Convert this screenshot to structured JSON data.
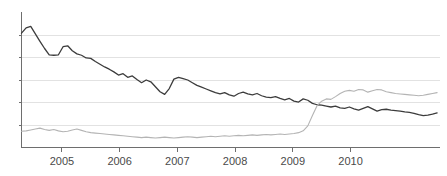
{
  "chart_data": {
    "type": "line",
    "title": "",
    "subtitle": "",
    "xlabel": "",
    "ylabel": "",
    "grid": true,
    "grid_axis": "y",
    "legend": "none",
    "background_color": "#ffffff",
    "axis_color": "#6e6e6e",
    "gridline_color": "#e2e2e2",
    "xlim": [
      2004.3,
      2011.55
    ],
    "ylim": [
      0,
      6
    ],
    "xticks": [
      2005,
      2006,
      2007,
      2008,
      2009,
      2010
    ],
    "xtick_labels": [
      "2005",
      "2006",
      "2007",
      "2008",
      "2009",
      "2010"
    ],
    "yticks": [
      1,
      2,
      3,
      4,
      5
    ],
    "ytick_labels": [
      "",
      "",
      "",
      "",
      ""
    ],
    "series": [
      {
        "name": "series-dark",
        "color": "#3c3c3c",
        "line_width": 1.3,
        "x": [
          2004.3,
          2004.38,
          2004.46,
          2004.54,
          2004.62,
          2004.7,
          2004.78,
          2004.86,
          2004.94,
          2005.02,
          2005.1,
          2005.18,
          2005.26,
          2005.34,
          2005.42,
          2005.5,
          2005.58,
          2005.66,
          2005.74,
          2005.82,
          2005.9,
          2005.98,
          2006.06,
          2006.14,
          2006.22,
          2006.3,
          2006.38,
          2006.46,
          2006.54,
          2006.62,
          2006.7,
          2006.78,
          2006.86,
          2006.94,
          2007.02,
          2007.1,
          2007.18,
          2007.26,
          2007.34,
          2007.42,
          2007.5,
          2007.58,
          2007.66,
          2007.74,
          2007.82,
          2007.9,
          2007.98,
          2008.06,
          2008.14,
          2008.22,
          2008.3,
          2008.38,
          2008.46,
          2008.54,
          2008.62,
          2008.7,
          2008.78,
          2008.86,
          2008.94,
          2009.02,
          2009.1,
          2009.18,
          2009.26,
          2009.34,
          2009.42,
          2009.5,
          2009.58,
          2009.66,
          2009.74,
          2009.82,
          2009.9,
          2009.98,
          2010.06,
          2010.14,
          2010.22,
          2010.3,
          2010.38,
          2010.46,
          2010.54,
          2010.62,
          2010.7,
          2010.78,
          2010.86,
          2010.94,
          2011.02,
          2011.1,
          2011.18,
          2011.26,
          2011.34,
          2011.42,
          2011.5
        ],
        "values": [
          5.08,
          5.32,
          5.38,
          5.05,
          4.72,
          4.4,
          4.12,
          4.1,
          4.12,
          4.48,
          4.52,
          4.3,
          4.16,
          4.1,
          3.98,
          3.96,
          3.82,
          3.7,
          3.58,
          3.48,
          3.36,
          3.22,
          3.28,
          3.12,
          3.18,
          3.02,
          2.88,
          3.0,
          2.92,
          2.7,
          2.48,
          2.36,
          2.62,
          3.04,
          3.12,
          3.06,
          3.0,
          2.88,
          2.76,
          2.68,
          2.6,
          2.52,
          2.44,
          2.38,
          2.44,
          2.34,
          2.28,
          2.4,
          2.46,
          2.38,
          2.34,
          2.4,
          2.3,
          2.24,
          2.22,
          2.26,
          2.18,
          2.12,
          2.18,
          2.06,
          2.02,
          2.16,
          2.1,
          1.96,
          1.9,
          1.88,
          1.84,
          1.8,
          1.84,
          1.76,
          1.74,
          1.8,
          1.72,
          1.66,
          1.74,
          1.82,
          1.72,
          1.62,
          1.68,
          1.7,
          1.66,
          1.64,
          1.62,
          1.58,
          1.56,
          1.52,
          1.46,
          1.42,
          1.44,
          1.48,
          1.54
        ]
      },
      {
        "name": "series-light",
        "color": "#b4b4b4",
        "line_width": 1.1,
        "x": [
          2004.3,
          2004.38,
          2004.46,
          2004.54,
          2004.62,
          2004.7,
          2004.78,
          2004.86,
          2004.94,
          2005.02,
          2005.1,
          2005.18,
          2005.26,
          2005.34,
          2005.42,
          2005.5,
          2005.58,
          2005.66,
          2005.74,
          2005.82,
          2005.9,
          2005.98,
          2006.06,
          2006.14,
          2006.22,
          2006.3,
          2006.38,
          2006.46,
          2006.54,
          2006.62,
          2006.7,
          2006.78,
          2006.86,
          2006.94,
          2007.02,
          2007.1,
          2007.18,
          2007.26,
          2007.34,
          2007.42,
          2007.5,
          2007.58,
          2007.66,
          2007.74,
          2007.82,
          2007.9,
          2007.98,
          2008.06,
          2008.14,
          2008.22,
          2008.3,
          2008.38,
          2008.46,
          2008.54,
          2008.62,
          2008.7,
          2008.78,
          2008.86,
          2008.94,
          2009.02,
          2009.1,
          2009.18,
          2009.26,
          2009.34,
          2009.42,
          2009.5,
          2009.58,
          2009.66,
          2009.74,
          2009.82,
          2009.9,
          2009.98,
          2010.06,
          2010.14,
          2010.22,
          2010.3,
          2010.38,
          2010.46,
          2010.54,
          2010.62,
          2010.7,
          2010.78,
          2010.86,
          2010.94,
          2011.02,
          2011.1,
          2011.18,
          2011.26,
          2011.34,
          2011.42,
          2011.5
        ],
        "values": [
          0.72,
          0.74,
          0.78,
          0.82,
          0.86,
          0.8,
          0.76,
          0.8,
          0.74,
          0.7,
          0.72,
          0.78,
          0.82,
          0.76,
          0.7,
          0.66,
          0.64,
          0.62,
          0.6,
          0.58,
          0.56,
          0.54,
          0.52,
          0.5,
          0.48,
          0.46,
          0.44,
          0.46,
          0.44,
          0.42,
          0.44,
          0.46,
          0.44,
          0.42,
          0.44,
          0.46,
          0.48,
          0.46,
          0.44,
          0.46,
          0.48,
          0.5,
          0.48,
          0.5,
          0.52,
          0.5,
          0.52,
          0.54,
          0.52,
          0.54,
          0.56,
          0.54,
          0.56,
          0.58,
          0.56,
          0.58,
          0.6,
          0.58,
          0.6,
          0.62,
          0.66,
          0.74,
          0.96,
          1.42,
          1.86,
          2.06,
          2.16,
          2.14,
          2.26,
          2.4,
          2.5,
          2.54,
          2.5,
          2.58,
          2.56,
          2.46,
          2.52,
          2.58,
          2.56,
          2.48,
          2.44,
          2.4,
          2.38,
          2.36,
          2.34,
          2.32,
          2.3,
          2.32,
          2.36,
          2.4,
          2.44
        ]
      }
    ]
  }
}
